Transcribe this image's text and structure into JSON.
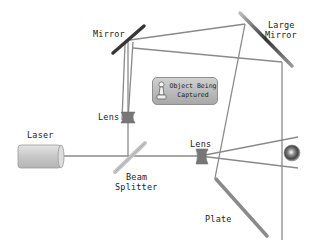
{
  "diagram": {
    "labels": {
      "mirror": "Mirror",
      "large_mirror_line1": "Large",
      "large_mirror_line2": "Mirror",
      "lens_upper": "Lens",
      "lens_lower": "Lens",
      "laser": "Laser",
      "beam_splitter_line1": "Beam",
      "beam_splitter_line2": "Splitter",
      "plate": "Plate",
      "object_line1": "Object Being",
      "object_line2": "Captured"
    },
    "colors": {
      "beam": "#888888",
      "mirror": "#555555",
      "plate": "#8a8a8a",
      "laser_body": "#cccccc",
      "lens": "#777777"
    }
  }
}
